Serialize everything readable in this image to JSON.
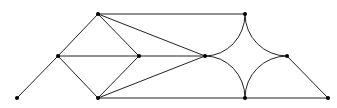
{
  "diagram": {
    "type": "graph",
    "width": 337,
    "height": 108,
    "colors": {
      "edge": "#222222",
      "node": "#000000",
      "background": "#ffffff"
    },
    "nodes": [
      {
        "id": "A",
        "x": 17,
        "y": 98
      },
      {
        "id": "B",
        "x": 58,
        "y": 56
      },
      {
        "id": "C",
        "x": 98,
        "y": 14
      },
      {
        "id": "D",
        "x": 139,
        "y": 56
      },
      {
        "id": "E",
        "x": 98,
        "y": 98
      },
      {
        "id": "F",
        "x": 205,
        "y": 56
      },
      {
        "id": "G",
        "x": 245,
        "y": 14
      },
      {
        "id": "H",
        "x": 287,
        "y": 56
      },
      {
        "id": "I",
        "x": 245,
        "y": 98
      },
      {
        "id": "J",
        "x": 328,
        "y": 98
      }
    ],
    "edges": [
      {
        "from": "A",
        "to": "B",
        "kind": "line"
      },
      {
        "from": "B",
        "to": "C",
        "kind": "line"
      },
      {
        "from": "B",
        "to": "D",
        "kind": "line"
      },
      {
        "from": "B",
        "to": "E",
        "kind": "line"
      },
      {
        "from": "C",
        "to": "D",
        "kind": "line"
      },
      {
        "from": "E",
        "to": "D",
        "kind": "line"
      },
      {
        "from": "C",
        "to": "G",
        "kind": "line"
      },
      {
        "from": "C",
        "to": "F",
        "kind": "line"
      },
      {
        "from": "E",
        "to": "F",
        "kind": "line"
      },
      {
        "from": "D",
        "to": "F",
        "kind": "line"
      },
      {
        "from": "E",
        "to": "I",
        "kind": "line"
      },
      {
        "from": "I",
        "to": "J",
        "kind": "line"
      },
      {
        "from": "H",
        "to": "J",
        "kind": "line"
      },
      {
        "from": "F",
        "to": "G",
        "kind": "arc"
      },
      {
        "from": "G",
        "to": "H",
        "kind": "arc"
      },
      {
        "from": "H",
        "to": "I",
        "kind": "arc"
      },
      {
        "from": "I",
        "to": "F",
        "kind": "arc"
      }
    ]
  }
}
